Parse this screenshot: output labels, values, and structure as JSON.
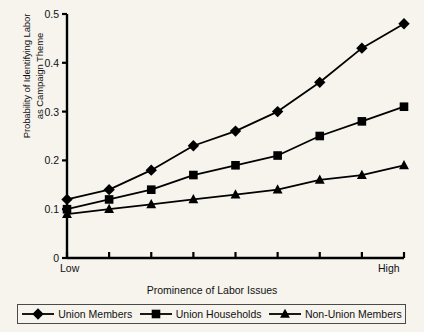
{
  "chart_data": {
    "type": "line",
    "title": "",
    "xlabel": "Prominence of Labor Issues",
    "ylabel": "Probability of Identifying Labor as Campaign Theme",
    "ylabel_line1": "Probability of Identifying Labor",
    "ylabel_line2": "as Campaign Theme",
    "x": [
      0,
      1,
      2,
      3,
      4,
      5,
      6,
      7,
      8
    ],
    "x_tick_labels": [
      "Low",
      "",
      "",
      "",
      "",
      "",
      "",
      "",
      "High"
    ],
    "x_axis_start_label": "Low",
    "x_axis_end_label": "High",
    "ylim": [
      0,
      0.5
    ],
    "y_ticks": [
      0,
      0.1,
      0.2,
      0.3,
      0.4,
      0.5
    ],
    "y_tick_labels": [
      "0",
      "0.1",
      "0.2",
      "0.3",
      "0.4",
      "0.5"
    ],
    "grid": false,
    "legend_position": "bottom",
    "series": [
      {
        "name": "Union Members",
        "marker": "diamond",
        "color": "#000000",
        "values": [
          0.12,
          0.14,
          0.18,
          0.23,
          0.26,
          0.3,
          0.36,
          0.43,
          0.48
        ]
      },
      {
        "name": "Union Households",
        "marker": "square",
        "color": "#000000",
        "values": [
          0.1,
          0.12,
          0.14,
          0.17,
          0.19,
          0.21,
          0.25,
          0.28,
          0.31
        ]
      },
      {
        "name": "Non-Union Members",
        "marker": "triangle",
        "color": "#000000",
        "values": [
          0.09,
          0.1,
          0.11,
          0.12,
          0.13,
          0.14,
          0.16,
          0.17,
          0.19
        ]
      }
    ]
  },
  "legend": {
    "items": [
      {
        "label": "Union Members",
        "marker": "diamond"
      },
      {
        "label": "Union Households",
        "marker": "square"
      },
      {
        "label": "Non-Union Members",
        "marker": "triangle"
      }
    ]
  }
}
